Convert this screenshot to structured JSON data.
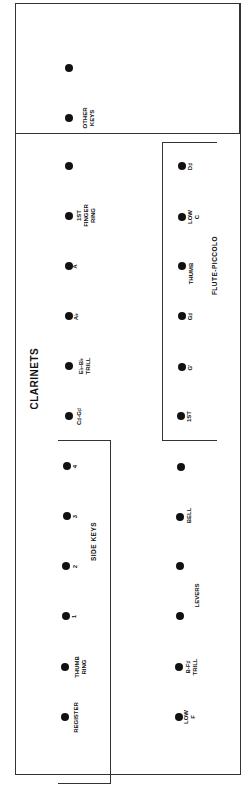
{
  "title": "CLARINETS",
  "groups": {
    "side_keys": "SIDE KEYS",
    "flute_piccolo": "FLUTE-PICCOLO"
  },
  "top_row": {
    "keys": [
      {
        "label": "",
        "y": 68
      },
      {
        "label": "OTHER\nKEYS",
        "y": 118
      },
      {
        "label": "",
        "y": 166
      },
      {
        "label": "1ST\nFINGER\nRING",
        "y": 216
      },
      {
        "label": "A",
        "y": 266
      },
      {
        "label": "A♭",
        "y": 316
      },
      {
        "label": "E♭-B♭\nTRILL",
        "y": 366
      },
      {
        "label": "C♯-G♯",
        "y": 416
      },
      {
        "label": "4",
        "y": 466
      },
      {
        "label": "3",
        "y": 516
      },
      {
        "label": "2",
        "y": 566
      },
      {
        "label": "1",
        "y": 616
      },
      {
        "label": "THUMB\nRING",
        "y": 666
      },
      {
        "label": "REGISTER",
        "y": 716
      }
    ]
  },
  "bottom_row": {
    "keys": [
      {
        "label": "D♯",
        "y": 166
      },
      {
        "label": "LOW\nC",
        "y": 216
      },
      {
        "label": "THUMB",
        "y": 266
      },
      {
        "label": "G♯",
        "y": 316
      },
      {
        "label": "G'",
        "y": 366
      },
      {
        "label": "1ST",
        "y": 416
      },
      {
        "label": "",
        "y": 466
      },
      {
        "label": "BELL",
        "y": 516
      },
      {
        "label": "LEVERS",
        "y": 566
      },
      {
        "label": "",
        "y": 616
      },
      {
        "label": "B-F♯\nTRILL",
        "y": 666
      },
      {
        "label": "LOW\nF",
        "y": 716
      }
    ]
  }
}
